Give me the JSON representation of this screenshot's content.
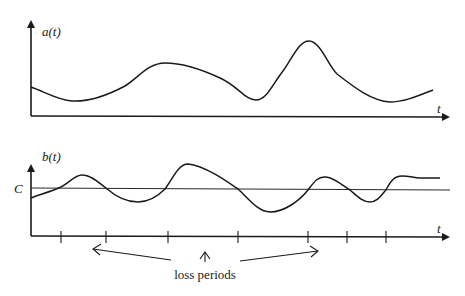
{
  "top_plot": {
    "y_label": "a(t)",
    "x_label": "t"
  },
  "bottom_plot": {
    "y_label": "b(t)",
    "x_label": "t",
    "threshold_label": "C",
    "tick_count": 7
  },
  "annotation": {
    "text": "loss periods"
  }
}
